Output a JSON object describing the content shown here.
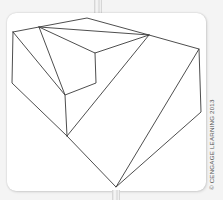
{
  "figure": {
    "line_color": "#3a3a3a",
    "card_color": "#ffffff",
    "background_color": "#f4f4f4",
    "credit": "© CENGAGE LEARNING 2013"
  }
}
